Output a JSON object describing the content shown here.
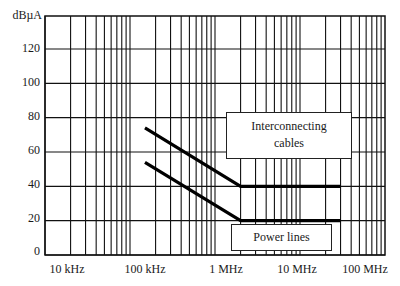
{
  "chart_data": {
    "type": "line",
    "title": "",
    "xlabel": "Frequency",
    "ylabel": "dBµA",
    "x_scale": "log",
    "xlim_hz": [
      10000,
      100000000
    ],
    "ylim": [
      0,
      139
    ],
    "grid": true,
    "x_ticks": [
      "10 kHz",
      "100 kHz",
      "1 MHz",
      "10 MHz",
      "100 MHz"
    ],
    "y_ticks": [
      0,
      20,
      40,
      60,
      80,
      100,
      120
    ],
    "series": [
      {
        "name": "Interconnecting cables",
        "x_hz": [
          150000,
          2000000,
          30000000
        ],
        "values": [
          74,
          40,
          40
        ]
      },
      {
        "name": "Power lines",
        "x_hz": [
          150000,
          2000000,
          30000000
        ],
        "values": [
          54,
          20,
          20
        ]
      }
    ],
    "annotations": [
      {
        "text": "Interconnecting cables",
        "target_series": "Interconnecting cables"
      },
      {
        "text": "Power lines",
        "target_series": "Power lines"
      }
    ],
    "legend": "none (boxed callout labels inside plot)"
  },
  "axis": {
    "unit_label": "dBµA",
    "y_tick_labels": [
      "120",
      "100",
      "80",
      "60",
      "40",
      "20",
      "0"
    ],
    "x_tick_labels": [
      "10 kHz",
      "100 kHz",
      "1 MHz",
      "10 MHz",
      "100 MHz"
    ]
  },
  "callouts": {
    "interconnecting_line1": "Interconnecting",
    "interconnecting_line2": "cables",
    "power": "Power lines"
  }
}
